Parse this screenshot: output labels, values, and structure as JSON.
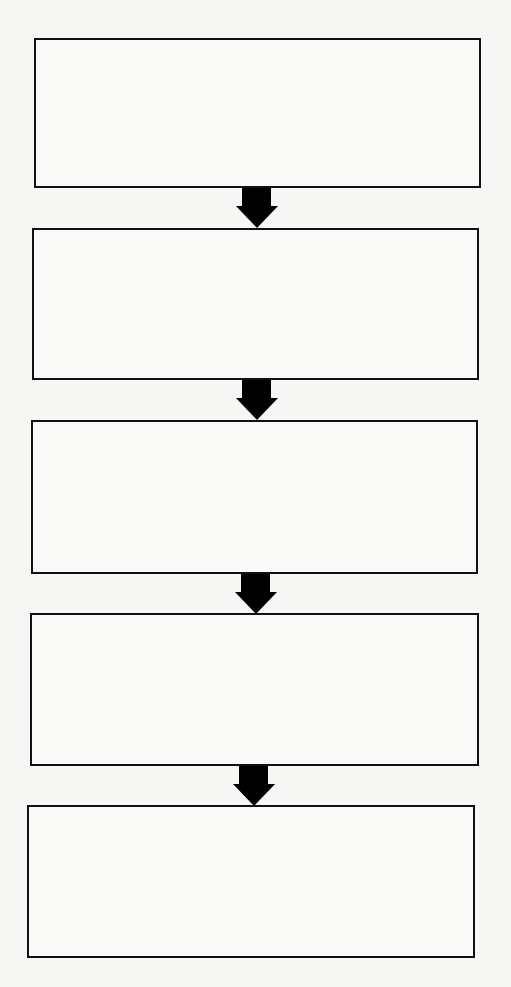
{
  "diagram": {
    "type": "flowchart",
    "direction": "top-to-bottom",
    "colors": {
      "background": "#f6f6f4",
      "stroke": "#111111",
      "arrow_fill": "#000000"
    },
    "nodes": [
      {
        "id": "step-1",
        "label": ""
      },
      {
        "id": "step-2",
        "label": ""
      },
      {
        "id": "step-3",
        "label": ""
      },
      {
        "id": "step-4",
        "label": ""
      },
      {
        "id": "step-5",
        "label": ""
      }
    ],
    "edges": [
      {
        "from": "step-1",
        "to": "step-2"
      },
      {
        "from": "step-2",
        "to": "step-3"
      },
      {
        "from": "step-3",
        "to": "step-4"
      },
      {
        "from": "step-4",
        "to": "step-5"
      }
    ]
  }
}
